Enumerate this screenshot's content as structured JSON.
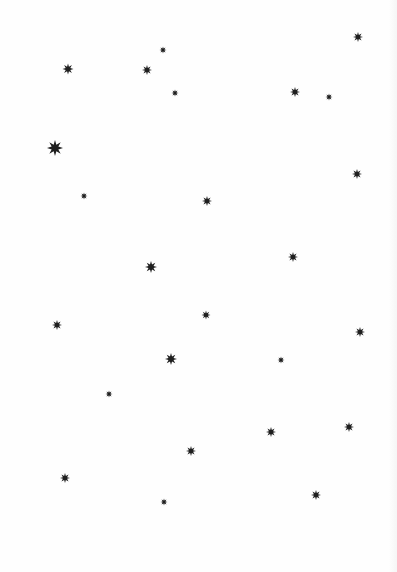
{
  "pattern": {
    "background": "#fefefe",
    "star_color": "#1f1f1f",
    "star_points": 8,
    "stars": [
      {
        "x": 358,
        "y": 37,
        "size": 10
      },
      {
        "x": 163,
        "y": 50,
        "size": 7
      },
      {
        "x": 68,
        "y": 69,
        "size": 11
      },
      {
        "x": 147,
        "y": 70,
        "size": 10
      },
      {
        "x": 175,
        "y": 93,
        "size": 7
      },
      {
        "x": 295,
        "y": 92,
        "size": 10
      },
      {
        "x": 329,
        "y": 97,
        "size": 7
      },
      {
        "x": 55,
        "y": 148,
        "size": 16
      },
      {
        "x": 357,
        "y": 174,
        "size": 10
      },
      {
        "x": 84,
        "y": 196,
        "size": 7
      },
      {
        "x": 207,
        "y": 201,
        "size": 10
      },
      {
        "x": 293,
        "y": 257,
        "size": 10
      },
      {
        "x": 151,
        "y": 267,
        "size": 12
      },
      {
        "x": 206,
        "y": 315,
        "size": 9
      },
      {
        "x": 57,
        "y": 325,
        "size": 10
      },
      {
        "x": 360,
        "y": 332,
        "size": 10
      },
      {
        "x": 171,
        "y": 359,
        "size": 12
      },
      {
        "x": 281,
        "y": 360,
        "size": 7
      },
      {
        "x": 109,
        "y": 394,
        "size": 7
      },
      {
        "x": 349,
        "y": 427,
        "size": 10
      },
      {
        "x": 271,
        "y": 432,
        "size": 10
      },
      {
        "x": 191,
        "y": 451,
        "size": 10
      },
      {
        "x": 65,
        "y": 478,
        "size": 10
      },
      {
        "x": 316,
        "y": 495,
        "size": 10
      },
      {
        "x": 164,
        "y": 502,
        "size": 7
      }
    ]
  }
}
